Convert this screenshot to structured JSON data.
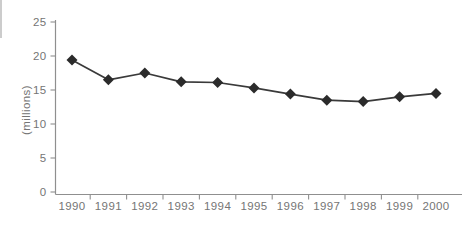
{
  "chart_data": {
    "type": "line",
    "title": "",
    "xlabel": "",
    "ylabel": "(millions)",
    "categories": [
      "1990",
      "1991",
      "1992",
      "1993",
      "1994",
      "1995",
      "1996",
      "1997",
      "1998",
      "1999",
      "2000"
    ],
    "series": [
      {
        "name": "millions",
        "values": [
          19.4,
          16.5,
          17.5,
          16.2,
          16.1,
          15.3,
          14.4,
          13.5,
          13.3,
          14.0,
          14.5
        ]
      }
    ],
    "ylim": [
      0,
      25
    ],
    "yticks": [
      0,
      5,
      10,
      15,
      20,
      25
    ],
    "grid": false,
    "legend": false,
    "marker": "diamond",
    "colors": {
      "line": "#3a3a3a",
      "marker": "#2b2b2b",
      "axis": "#8f8f8f",
      "tick": "#8f8f8f",
      "label": "#757575"
    }
  }
}
